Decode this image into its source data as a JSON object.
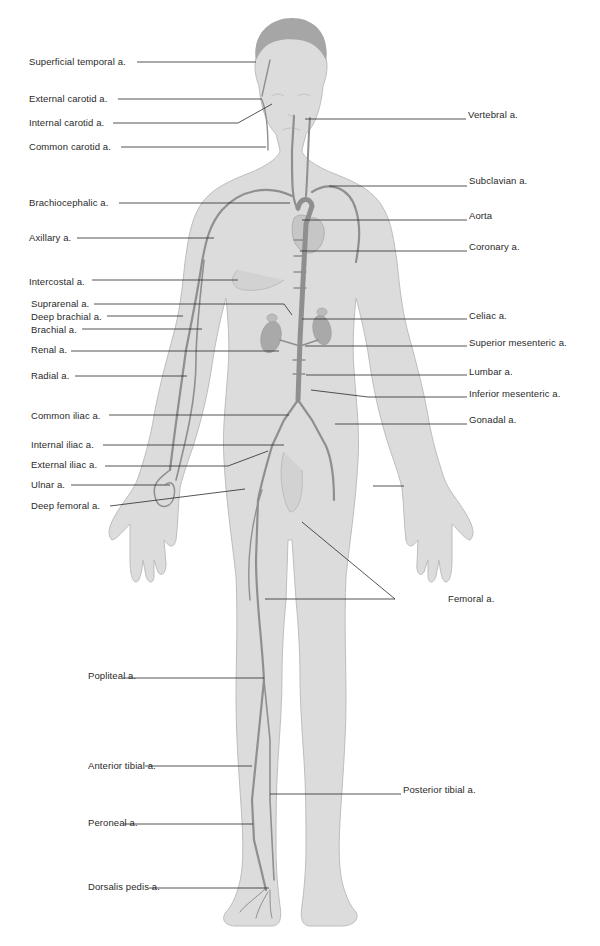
{
  "figure": {
    "colors": {
      "background": "#ffffff",
      "body_fill": "#dcdcdc",
      "body_outline": "#b9b9b9",
      "artery": "#8f8f8f",
      "organ": "#a9a9a9",
      "leader_line": "#2a2a2a",
      "label_text": "#2a2a2a"
    }
  },
  "labels_left": [
    {
      "text": "Superficial temporal a.",
      "x": 29,
      "y": 56,
      "line": [
        [
          137,
          62
        ],
        [
          256,
          62
        ]
      ]
    },
    {
      "text": "External carotid a.",
      "x": 29,
      "y": 93,
      "line": [
        [
          118,
          99
        ],
        [
          262,
          99
        ]
      ]
    },
    {
      "text": "Internal carotid a.",
      "x": 29,
      "y": 117,
      "line": [
        [
          113,
          123
        ],
        [
          238,
          123
        ],
        [
          272,
          104
        ]
      ]
    },
    {
      "text": "Common carotid a.",
      "x": 29,
      "y": 141,
      "line": [
        [
          121,
          147
        ],
        [
          266,
          147
        ]
      ]
    },
    {
      "text": "Brachiocephalic a.",
      "x": 29,
      "y": 197,
      "line": [
        [
          119,
          203
        ],
        [
          290,
          203
        ]
      ]
    },
    {
      "text": "Axillary a.",
      "x": 29,
      "y": 232,
      "line": [
        [
          77,
          238
        ],
        [
          214,
          238
        ]
      ]
    },
    {
      "text": "Intercostal a.",
      "x": 29,
      "y": 276,
      "line": [
        [
          92,
          280
        ],
        [
          238,
          280
        ]
      ]
    },
    {
      "text": "Suprarenal a.",
      "x": 31,
      "y": 298,
      "line": [
        [
          94,
          304
        ],
        [
          284,
          304
        ],
        [
          292,
          315
        ]
      ]
    },
    {
      "text": "Deep brachial a.",
      "x": 31,
      "y": 311,
      "line": [
        [
          107,
          316
        ],
        [
          183,
          316
        ]
      ]
    },
    {
      "text": "Brachial a.",
      "x": 31,
      "y": 324,
      "line": [
        [
          82,
          329
        ],
        [
          202,
          329
        ]
      ]
    },
    {
      "text": "Renal a.",
      "x": 31,
      "y": 344,
      "line": [
        [
          71,
          351
        ],
        [
          279,
          351
        ]
      ]
    },
    {
      "text": "Radial a.",
      "x": 31,
      "y": 370,
      "line": [
        [
          75,
          376
        ],
        [
          187,
          376
        ]
      ]
    },
    {
      "text": "Common iliac a.",
      "x": 31,
      "y": 410,
      "line": [
        [
          109,
          415
        ],
        [
          289,
          415
        ]
      ]
    },
    {
      "text": "Internal iliac a.",
      "x": 31,
      "y": 439,
      "line": [
        [
          103,
          445
        ],
        [
          284,
          445
        ]
      ]
    },
    {
      "text": "External iliac a.",
      "x": 31,
      "y": 459,
      "line": [
        [
          105,
          466
        ],
        [
          228,
          466
        ],
        [
          268,
          451
        ]
      ]
    },
    {
      "text": "Ulnar a.",
      "x": 31,
      "y": 479,
      "line": [
        [
          71,
          485
        ],
        [
          170,
          485
        ]
      ]
    },
    {
      "text": "Deep femoral a.",
      "x": 31,
      "y": 500,
      "line": [
        [
          110,
          506
        ],
        [
          245,
          489
        ]
      ]
    },
    {
      "text": "Popliteal a.",
      "x": 88,
      "y": 670,
      "line": [
        [
          123,
          678
        ],
        [
          264,
          678
        ]
      ]
    },
    {
      "text": "Anterior tibial a.",
      "x": 88,
      "y": 760,
      "line": [
        [
          145,
          766
        ],
        [
          252,
          766
        ]
      ]
    },
    {
      "text": "Peroneal a.",
      "x": 88,
      "y": 817,
      "line": [
        [
          124,
          824
        ],
        [
          253,
          824
        ]
      ]
    },
    {
      "text": "Dorsalis pedis a.",
      "x": 88,
      "y": 881,
      "line": [
        [
          149,
          888
        ],
        [
          269,
          888
        ]
      ]
    }
  ],
  "labels_right": [
    {
      "text": "Vertebral a.",
      "x": 468,
      "y": 109,
      "line": [
        [
          305,
          119
        ],
        [
          466,
          119
        ]
      ]
    },
    {
      "text": "Subclavian a.",
      "x": 469,
      "y": 175,
      "line": [
        [
          329,
          186
        ],
        [
          467,
          186
        ]
      ]
    },
    {
      "text": "Aorta",
      "x": 469,
      "y": 210,
      "line": [
        [
          302,
          220
        ],
        [
          467,
          220
        ]
      ]
    },
    {
      "text": "Coronary a.",
      "x": 469,
      "y": 241,
      "line": [
        [
          300,
          251
        ],
        [
          467,
          251
        ]
      ]
    },
    {
      "text": "Celiac a.",
      "x": 469,
      "y": 310,
      "line": [
        [
          302,
          319
        ],
        [
          467,
          319
        ]
      ]
    },
    {
      "text": "Superior mesenteric a.",
      "x": 469,
      "y": 337,
      "line": [
        [
          305,
          346
        ],
        [
          467,
          346
        ]
      ]
    },
    {
      "text": "Lumbar a.",
      "x": 469,
      "y": 366,
      "line": [
        [
          306,
          375
        ],
        [
          467,
          375
        ]
      ]
    },
    {
      "text": "Inferior mesenteric a.",
      "x": 469,
      "y": 388,
      "line": [
        [
          311,
          390
        ],
        [
          368,
          397
        ],
        [
          467,
          397
        ]
      ]
    },
    {
      "text": "Gonadal a.",
      "x": 469,
      "y": 414,
      "line": [
        [
          335,
          424
        ],
        [
          467,
          424
        ]
      ]
    },
    {
      "text": "Femoral a.",
      "x": 448,
      "y": 593,
      "line": [
        [
          265,
          599
        ],
        [
          395,
          599
        ],
        [
          302,
          522
        ]
      ]
    },
    {
      "text": "Posterior tibial a.",
      "x": 403,
      "y": 784,
      "line": [
        [
          270,
          794
        ],
        [
          401,
          794
        ]
      ]
    }
  ],
  "extra_leaders": [
    {
      "name": "ulnar-right-hand-leader",
      "line": [
        [
          373,
          486
        ],
        [
          404,
          486
        ]
      ]
    }
  ]
}
